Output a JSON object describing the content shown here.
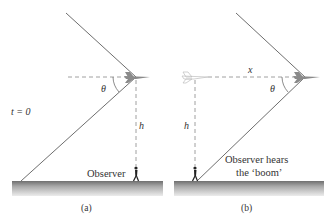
{
  "panels": [
    {
      "id": "a",
      "caption": "(a)",
      "time_label": "t = 0",
      "angle_label": "θ",
      "height_label": "h",
      "observer_label": "Observer"
    },
    {
      "id": "b",
      "caption": "(b)",
      "angle_label": "θ",
      "height_label": "h",
      "distance_label": "x",
      "observer_label_line1": "Observer hears",
      "observer_label_line2": "the ‘boom’"
    }
  ],
  "colors": {
    "line": "#6e6e6e",
    "dashed": "#888888",
    "ground_top": "#7a7a7a",
    "ground_bottom": "#e6e6e6",
    "text": "#333333",
    "plane": "#8a8a8a",
    "plane_faint": "#c8c8c8"
  }
}
